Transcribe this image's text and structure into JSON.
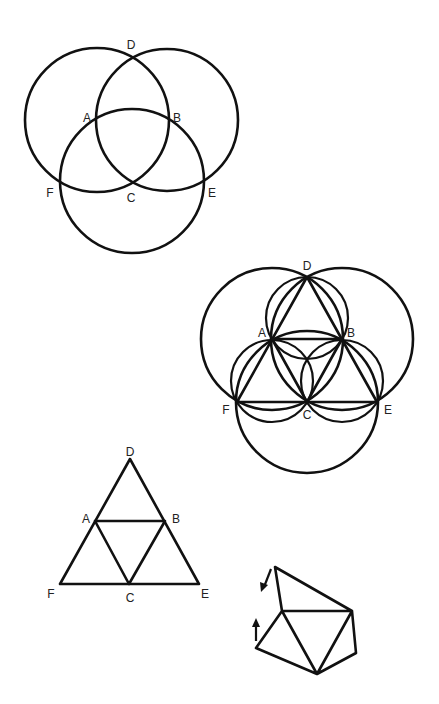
{
  "figure": {
    "stroke_color": "#111111",
    "background": "#ffffff"
  },
  "diagram_1": {
    "description": "Three equal circles centered at A, B, C",
    "labels": {
      "D": {
        "text": "D",
        "x": 131,
        "y": 49
      },
      "A": {
        "text": "A",
        "x": 87,
        "y": 121
      },
      "B": {
        "text": "B",
        "x": 177,
        "y": 121
      },
      "F": {
        "text": "F",
        "x": 50,
        "y": 197
      },
      "C": {
        "text": "C",
        "x": 131,
        "y": 202
      },
      "E": {
        "text": "E",
        "x": 212,
        "y": 197
      }
    }
  },
  "diagram_2": {
    "description": "Three circles with inscribed triangle DFE subdivided into four triangles",
    "labels": {
      "D": {
        "text": "D",
        "x": 307,
        "y": 270
      },
      "A": {
        "text": "A",
        "x": 262,
        "y": 336
      },
      "B": {
        "text": "B",
        "x": 351,
        "y": 336
      },
      "F": {
        "text": "F",
        "x": 226,
        "y": 414
      },
      "C": {
        "text": "C",
        "x": 307,
        "y": 419
      },
      "E": {
        "text": "E",
        "x": 388,
        "y": 414
      }
    }
  },
  "diagram_3": {
    "description": "Equilateral triangle DFE subdivided into four triangles via midpoints A, B, C",
    "labels": {
      "D": {
        "text": "D",
        "x": 130,
        "y": 456
      },
      "A": {
        "text": "A",
        "x": 86,
        "y": 523
      },
      "B": {
        "text": "B",
        "x": 176,
        "y": 523
      },
      "F": {
        "text": "F",
        "x": 51,
        "y": 598
      },
      "C": {
        "text": "C",
        "x": 130,
        "y": 602
      },
      "E": {
        "text": "E",
        "x": 205,
        "y": 598
      }
    }
  },
  "diagram_4": {
    "description": "Folding net of triangles with two direction arrows",
    "arrows": [
      "down-left-arrow",
      "up-arrow"
    ]
  }
}
